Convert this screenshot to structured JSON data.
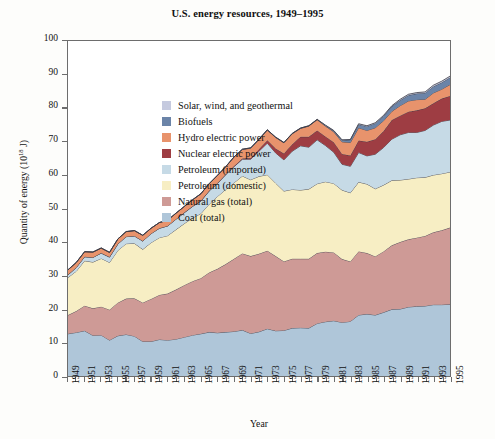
{
  "chart_data": {
    "type": "area",
    "title": "U.S. energy resources, 1949–1995",
    "xlabel": "Year",
    "ylabel": "Quantity of energy (10^18 J)",
    "ylabel_base": "Quantity of energy (10",
    "ylabel_exp": "18",
    "ylabel_tail": " J)",
    "stacked": true,
    "grid": false,
    "legend_position": "top-left inside plot",
    "ylim": [
      0,
      100
    ],
    "yticks": [
      0,
      10,
      20,
      30,
      40,
      50,
      60,
      70,
      80,
      90,
      100
    ],
    "xlim": [
      1949,
      1995
    ],
    "x": [
      1949,
      1950,
      1951,
      1952,
      1953,
      1954,
      1955,
      1956,
      1957,
      1958,
      1959,
      1960,
      1961,
      1962,
      1963,
      1964,
      1965,
      1966,
      1967,
      1968,
      1969,
      1970,
      1971,
      1972,
      1973,
      1974,
      1975,
      1976,
      1977,
      1978,
      1979,
      1980,
      1981,
      1982,
      1983,
      1984,
      1985,
      1986,
      1987,
      1988,
      1989,
      1990,
      1991,
      1992,
      1993,
      1994,
      1995
    ],
    "xtick_labels": [
      "1949",
      "1951",
      "1953",
      "1955",
      "1957",
      "1959",
      "1961",
      "1963",
      "1965",
      "1967",
      "1969",
      "1971",
      "1973",
      "1975",
      "1977",
      "1979",
      "1981",
      "1983",
      "1985",
      "1987",
      "1989",
      "1991",
      "1993",
      "1995"
    ],
    "series": [
      {
        "name": "Coal (total)",
        "color": "#afc6d9",
        "values": [
          12.6,
          13.0,
          13.5,
          12.1,
          12.2,
          10.7,
          12.0,
          12.4,
          11.9,
          10.3,
          10.3,
          10.9,
          10.7,
          11.0,
          11.6,
          12.2,
          12.6,
          13.1,
          12.9,
          13.1,
          13.3,
          13.7,
          12.7,
          13.2,
          14.1,
          13.5,
          13.6,
          14.3,
          14.4,
          14.3,
          15.7,
          16.2,
          16.5,
          16.0,
          16.3,
          18.2,
          18.5,
          18.2,
          19.0,
          19.9,
          20.0,
          20.6,
          20.8,
          20.9,
          21.3,
          21.3,
          21.4
        ]
      },
      {
        "name": "Natural gas (total)",
        "color": "#ce9a96",
        "values": [
          5.6,
          6.4,
          7.5,
          8.1,
          8.5,
          9.1,
          9.9,
          10.7,
          11.3,
          11.6,
          12.7,
          13.3,
          13.9,
          14.8,
          15.5,
          16.1,
          16.6,
          17.8,
          19.1,
          20.3,
          21.7,
          22.9,
          23.1,
          23.3,
          23.3,
          22.3,
          20.6,
          20.7,
          20.6,
          20.7,
          21.0,
          20.9,
          20.4,
          18.9,
          17.9,
          19.0,
          18.2,
          17.5,
          18.2,
          19.1,
          20.0,
          20.2,
          20.5,
          20.9,
          21.6,
          22.2,
          22.9
        ]
      },
      {
        "name": "Petroleum (domestic)",
        "color": "#f7eec4",
        "values": [
          11.2,
          11.9,
          13.4,
          13.8,
          14.4,
          14.1,
          15.6,
          16.4,
          16.4,
          15.9,
          16.8,
          17.1,
          17.3,
          17.9,
          18.4,
          18.9,
          19.3,
          20.4,
          21.6,
          22.3,
          22.7,
          23.1,
          22.8,
          23.1,
          22.7,
          21.8,
          21.0,
          20.7,
          20.5,
          20.8,
          20.7,
          20.9,
          20.6,
          20.6,
          20.5,
          20.7,
          20.6,
          20.2,
          19.8,
          19.4,
          18.5,
          18.0,
          17.9,
          17.5,
          17.1,
          16.9,
          16.6
        ]
      },
      {
        "name": "Petroleum (imported)",
        "color": "#c6dae6",
        "values": [
          0.8,
          1.1,
          1.2,
          1.4,
          1.6,
          1.6,
          1.9,
          2.1,
          2.2,
          2.5,
          2.7,
          2.8,
          2.9,
          3.1,
          3.2,
          3.4,
          3.7,
          3.9,
          3.9,
          4.4,
          4.8,
          5.0,
          6.1,
          7.5,
          9.4,
          9.0,
          9.3,
          11.4,
          13.2,
          12.5,
          13.1,
          10.8,
          9.3,
          7.7,
          7.9,
          8.8,
          8.4,
          10.3,
          11.2,
          12.3,
          13.5,
          13.9,
          13.5,
          14.0,
          14.9,
          15.6,
          15.5
        ]
      },
      {
        "name": "Nuclear electric power",
        "color": "#9e3d43",
        "values": [
          0.0,
          0.0,
          0.0,
          0.0,
          0.0,
          0.0,
          0.0,
          0.0,
          0.0,
          0.0,
          0.0,
          0.0,
          0.0,
          0.0,
          0.1,
          0.1,
          0.1,
          0.1,
          0.1,
          0.1,
          0.2,
          0.2,
          0.4,
          0.6,
          0.9,
          1.3,
          1.9,
          2.1,
          2.7,
          3.1,
          2.8,
          2.7,
          3.0,
          3.1,
          3.2,
          3.6,
          4.2,
          4.5,
          4.9,
          5.7,
          5.7,
          6.2,
          6.6,
          6.6,
          6.5,
          6.8,
          7.2
        ]
      },
      {
        "name": "Hydro electric power",
        "color": "#e8936c",
        "values": [
          1.5,
          1.5,
          1.5,
          1.6,
          1.5,
          1.4,
          1.5,
          1.5,
          1.6,
          1.7,
          1.6,
          1.7,
          1.7,
          1.8,
          1.8,
          1.9,
          2.1,
          2.1,
          2.3,
          2.3,
          2.7,
          2.7,
          2.9,
          2.9,
          3.0,
          3.3,
          3.2,
          3.1,
          2.5,
          3.2,
          3.2,
          3.1,
          3.1,
          3.6,
          3.9,
          3.8,
          3.4,
          3.4,
          3.1,
          2.6,
          3.0,
          3.2,
          3.2,
          2.7,
          3.1,
          2.8,
          3.4
        ]
      },
      {
        "name": "Biofuels",
        "color": "#6b84a8",
        "values": [
          0.0,
          0.0,
          0.0,
          0.0,
          0.0,
          0.0,
          0.0,
          0.0,
          0.0,
          0.0,
          0.0,
          0.0,
          0.0,
          0.0,
          0.0,
          0.0,
          0.0,
          0.0,
          0.0,
          0.0,
          0.0,
          0.1,
          0.1,
          0.1,
          0.1,
          0.1,
          0.1,
          0.1,
          0.1,
          0.1,
          0.1,
          0.2,
          0.3,
          0.5,
          0.8,
          1.0,
          1.2,
          1.3,
          1.4,
          1.5,
          1.6,
          1.7,
          1.8,
          1.9,
          1.9,
          2.0,
          2.1
        ]
      },
      {
        "name": "Solar, wind, and geothermal",
        "color": "#c5cadf",
        "values": [
          0.0,
          0.0,
          0.0,
          0.0,
          0.0,
          0.0,
          0.0,
          0.0,
          0.0,
          0.0,
          0.0,
          0.0,
          0.0,
          0.0,
          0.0,
          0.0,
          0.0,
          0.0,
          0.0,
          0.0,
          0.0,
          0.0,
          0.0,
          0.0,
          0.0,
          0.0,
          0.0,
          0.0,
          0.0,
          0.0,
          0.0,
          0.1,
          0.1,
          0.1,
          0.1,
          0.2,
          0.2,
          0.2,
          0.2,
          0.2,
          0.3,
          0.3,
          0.3,
          0.3,
          0.4,
          0.4,
          0.4
        ]
      }
    ],
    "legend_order": [
      "Solar, wind, and geothermal",
      "Biofuels",
      "Hydro electric power",
      "Nuclear electric power",
      "Petroleum (imported)",
      "Petroleum (domestic)",
      "Natural gas (total)",
      "Coal (total)"
    ]
  },
  "legend": [
    {
      "label": "Solar, wind, and geothermal",
      "color": "#c5cadf"
    },
    {
      "label": "Biofuels",
      "color": "#6b84a8"
    },
    {
      "label": "Hydro electric power",
      "color": "#e8936c"
    },
    {
      "label": "Nuclear electric power",
      "color": "#9e3d43"
    },
    {
      "label": "Petroleum (imported)",
      "color": "#c6dae6"
    },
    {
      "label": "Petroleum (domestic)",
      "color": "#f7eec4"
    },
    {
      "label": "Natural gas (total)",
      "color": "#ce9a96"
    },
    {
      "label": "Coal (total)",
      "color": "#afc6d9"
    }
  ]
}
